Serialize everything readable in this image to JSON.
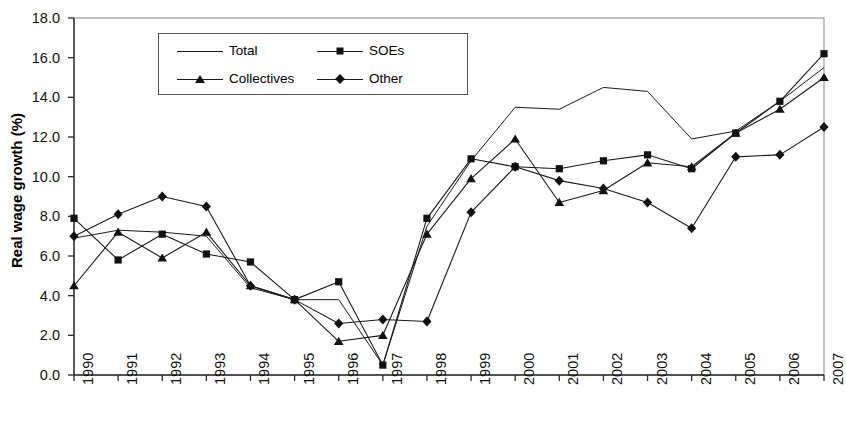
{
  "chart_data": {
    "type": "line",
    "title": "",
    "xlabel": "",
    "ylabel": "Real wage growth (%)",
    "categories": [
      "1990",
      "1991",
      "1992",
      "1993",
      "1994",
      "1995",
      "1996",
      "1997",
      "1998",
      "1999",
      "2000",
      "2001",
      "2002",
      "2003",
      "2004",
      "2005",
      "2006",
      "2007"
    ],
    "x": [
      1990,
      1991,
      1992,
      1993,
      1994,
      1995,
      1996,
      1997,
      1998,
      1999,
      2000,
      2001,
      2002,
      2003,
      2004,
      2005,
      2006,
      2007
    ],
    "ylim": [
      0.0,
      18.0
    ],
    "xlim": [
      1990,
      2007
    ],
    "yticks": [
      "0.0",
      "2.0",
      "4.0",
      "6.0",
      "8.0",
      "10.0",
      "12.0",
      "14.0",
      "16.0",
      "18.0"
    ],
    "ytick_values": [
      0.0,
      2.0,
      4.0,
      6.0,
      8.0,
      10.0,
      12.0,
      14.0,
      16.0,
      18.0
    ],
    "grid": false,
    "legend_position": "top-center-inside",
    "series": [
      {
        "name": "Total",
        "marker": "none",
        "color": "#1a1a1a",
        "values": [
          6.9,
          7.3,
          7.2,
          7.0,
          4.4,
          3.8,
          3.8,
          0.5,
          7.5,
          10.8,
          13.5,
          13.4,
          14.5,
          14.3,
          11.9,
          12.3,
          13.8,
          15.5
        ]
      },
      {
        "name": "SOEs",
        "marker": "square",
        "color": "#1a1a1a",
        "values": [
          7.9,
          5.8,
          7.1,
          6.1,
          5.7,
          3.8,
          4.7,
          0.5,
          7.9,
          10.9,
          10.5,
          10.4,
          10.8,
          11.1,
          10.4,
          12.2,
          13.8,
          16.2
        ]
      },
      {
        "name": "Collectives",
        "marker": "triangle",
        "color": "#1a1a1a",
        "values": [
          4.5,
          7.2,
          5.9,
          7.2,
          4.5,
          3.8,
          1.7,
          2.0,
          7.1,
          9.9,
          11.9,
          8.7,
          9.3,
          10.7,
          10.5,
          12.2,
          13.4,
          15.0
        ]
      },
      {
        "name": "Other",
        "marker": "diamond",
        "color": "#1a1a1a",
        "values": [
          7.0,
          8.1,
          9.0,
          8.5,
          4.5,
          3.8,
          2.6,
          2.8,
          2.7,
          8.2,
          10.5,
          9.8,
          9.4,
          8.7,
          7.4,
          11.0,
          11.1,
          12.5
        ]
      }
    ]
  },
  "legend": {
    "entries": [
      {
        "label": "Total",
        "marker": "none"
      },
      {
        "label": "SOEs",
        "marker": "square"
      },
      {
        "label": "Collectives",
        "marker": "triangle"
      },
      {
        "label": "Other",
        "marker": "diamond"
      }
    ]
  }
}
